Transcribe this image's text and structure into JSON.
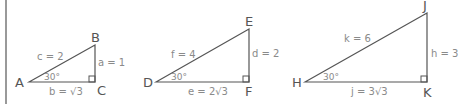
{
  "diagram": {
    "triangles": [
      {
        "id": "ABC",
        "vertices": {
          "A": "A",
          "B": "B",
          "C": "C"
        },
        "sides": {
          "c": "c = 2",
          "a": "a = 1",
          "b": "b = √3"
        },
        "angle": "30°"
      },
      {
        "id": "DEF",
        "vertices": {
          "D": "D",
          "E": "E",
          "F": "F"
        },
        "sides": {
          "f": "f = 4",
          "d": "d = 2",
          "e": "e = 2√3"
        },
        "angle": "30°"
      },
      {
        "id": "HJK",
        "vertices": {
          "H": "H",
          "J": "J",
          "K": "K"
        },
        "sides": {
          "k": "k = 6",
          "h": "h = 3",
          "j": "j = 3√3"
        },
        "angle": "30°"
      }
    ]
  }
}
